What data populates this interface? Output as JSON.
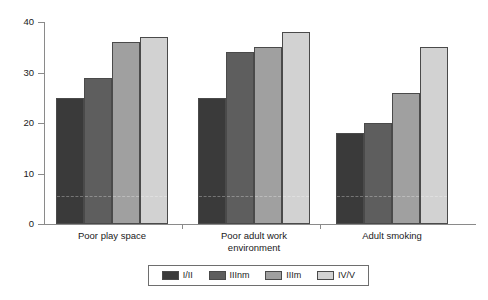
{
  "chart_data": {
    "type": "bar",
    "title": "",
    "subtitle": "",
    "xlabel": "",
    "ylabel": "",
    "ylim": [
      0,
      40
    ],
    "yticks": [
      0,
      10,
      20,
      30,
      40
    ],
    "ytick_labels": [
      "0",
      "10",
      "20",
      "30",
      "40"
    ],
    "grid": false,
    "legend_position": "bottom",
    "categories": [
      "Poor play space",
      "Poor adult work\nenvironment",
      "Adult smoking"
    ],
    "series": [
      {
        "name": "I/II",
        "color": "#3a3a3a",
        "values": [
          25,
          25,
          18
        ]
      },
      {
        "name": "IIInm",
        "color": "#5e5e5e",
        "values": [
          29,
          34,
          20
        ]
      },
      {
        "name": "IIIm",
        "color": "#a0a0a0",
        "values": [
          36,
          35,
          26
        ]
      },
      {
        "name": "IV/V",
        "color": "#d2d2d2",
        "values": [
          37,
          38,
          35
        ]
      }
    ]
  },
  "legend": {
    "items": [
      {
        "label": "I/II"
      },
      {
        "label": "IIInm"
      },
      {
        "label": "IIIm"
      },
      {
        "label": "IV/V"
      }
    ]
  },
  "axes": {
    "y_tick_labels": [
      "40",
      "30",
      "20",
      "10",
      "0"
    ]
  }
}
